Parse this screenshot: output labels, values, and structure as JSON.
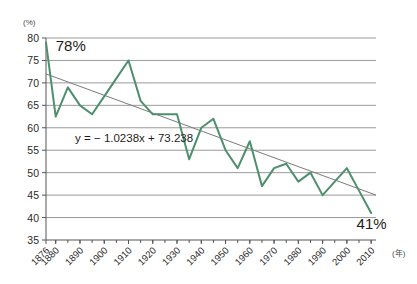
{
  "chart_data": {
    "type": "line",
    "title": "",
    "subtitle": "",
    "xlabel": "(年)",
    "ylabel": "(%)",
    "ylim": [
      35,
      80
    ],
    "ytick_step": 5,
    "yticks": [
      "80",
      "75",
      "70",
      "65",
      "60",
      "55",
      "50",
      "45",
      "40",
      "35"
    ],
    "xlim": [
      1876,
      2012
    ],
    "xticks": [
      "1876",
      "1880",
      "1890",
      "1900",
      "1910",
      "1920",
      "1930",
      "1940",
      "1950",
      "1960",
      "1970",
      "1980",
      "1990",
      "2000",
      "2010"
    ],
    "xtick_values": [
      1876,
      1880,
      1890,
      1900,
      1910,
      1920,
      1930,
      1940,
      1950,
      1960,
      1970,
      1980,
      1990,
      2000,
      2010
    ],
    "xtick_rotation_deg": -45,
    "minor_tick_step_years": 5,
    "grid": "horizontal",
    "legend": "none",
    "line_color": "#4e8f6d",
    "trend_color": "#7a7a7a",
    "grid_color": "#9a9a9a",
    "axis_color": "#555555",
    "series": [
      {
        "name": "value",
        "x": [
          1876,
          1880,
          1885,
          1890,
          1895,
          1900,
          1905,
          1910,
          1915,
          1920,
          1925,
          1930,
          1935,
          1940,
          1945,
          1950,
          1955,
          1960,
          1965,
          1970,
          1975,
          1980,
          1985,
          1990,
          1995,
          2000,
          2005,
          2010
        ],
        "values": [
          79,
          62.5,
          69,
          65,
          63,
          67,
          71,
          75,
          66,
          63,
          63,
          63,
          53,
          60,
          62,
          55,
          51,
          57,
          47,
          51,
          52,
          48,
          50,
          45,
          48,
          51,
          46,
          41
        ]
      }
    ],
    "trendline": {
      "equation": "y = − 1.0238x + 73.238",
      "slope": -1.0238,
      "intercept": 73.238,
      "y_start": 72,
      "y_end": 45
    },
    "annotations": [
      {
        "name": "start-value-label",
        "text": "78%",
        "x": 1880,
        "y": 77
      },
      {
        "name": "equation-label",
        "text": "y = − 1.0238x + 73.238",
        "x": 1888,
        "y": 56.8
      },
      {
        "name": "end-value-label",
        "text": "41%",
        "x": 2004,
        "y": 37.4
      }
    ]
  }
}
